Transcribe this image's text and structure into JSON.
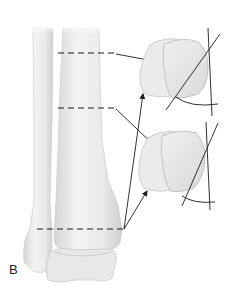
{
  "figure": {
    "panel_label": "B",
    "colors": {
      "bone_fill": "#ececec",
      "bone_shade": "#d4d4d4",
      "outline": "#b9b9b9",
      "line": "#1a1a1a",
      "background": "#ffffff"
    },
    "structures": [
      {
        "id": "fibula",
        "label": ""
      },
      {
        "id": "tibia",
        "label": ""
      },
      {
        "id": "talus",
        "label": ""
      }
    ],
    "section_levels": [
      {
        "id": "level-1",
        "y": 53,
        "target": "cross-section-top"
      },
      {
        "id": "level-2",
        "y": 108,
        "target": "cross-section-bottom"
      },
      {
        "id": "level-3",
        "y": 229,
        "targets": [
          "cross-section-top",
          "cross-section-bottom"
        ]
      }
    ],
    "cross_sections": [
      {
        "id": "cross-section-top",
        "has_angle_lines": true,
        "has_arc": true
      },
      {
        "id": "cross-section-bottom",
        "has_angle_lines": true,
        "has_arc": true
      }
    ]
  }
}
